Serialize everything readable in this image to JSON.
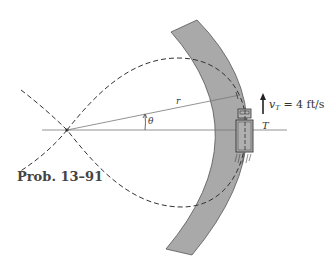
{
  "figure": {
    "caption": "Prob. 13–91",
    "labels": {
      "radius": "r",
      "angle": "θ",
      "point": "T",
      "velocity_symbol": "v",
      "velocity_subscript": "T",
      "velocity_value": " = 4 ft/s"
    },
    "colors": {
      "road_fill": "#a9a9a9",
      "road_edge": "#555555",
      "line": "#666666",
      "dash": "#333333",
      "background": "#ffffff"
    },
    "elements": {
      "road": "curved gray road band",
      "path": "dashed curved path (lemniscate-like lobe)",
      "origin": "pole at intersection of dashed curves",
      "reference_axis": "horizontal line through origin",
      "radial_line": "line r from origin to truck path",
      "angle_arc": "small arc indicating theta",
      "truck": "truck T on road",
      "velocity_arrow": "upward arrow for v_T"
    }
  }
}
